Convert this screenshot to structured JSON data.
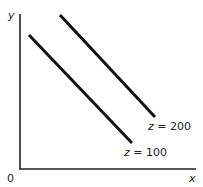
{
  "diagram": {
    "axes": {
      "x_label": "x",
      "y_label": "y",
      "origin_label": "0"
    },
    "lines": [
      {
        "label_var": "z",
        "label_eq": " = 100",
        "value": 100
      },
      {
        "label_var": "z",
        "label_eq": " = 200",
        "value": 200
      }
    ],
    "colors": {
      "line": "#111111",
      "axis": "#222222",
      "text": "#222222"
    }
  }
}
